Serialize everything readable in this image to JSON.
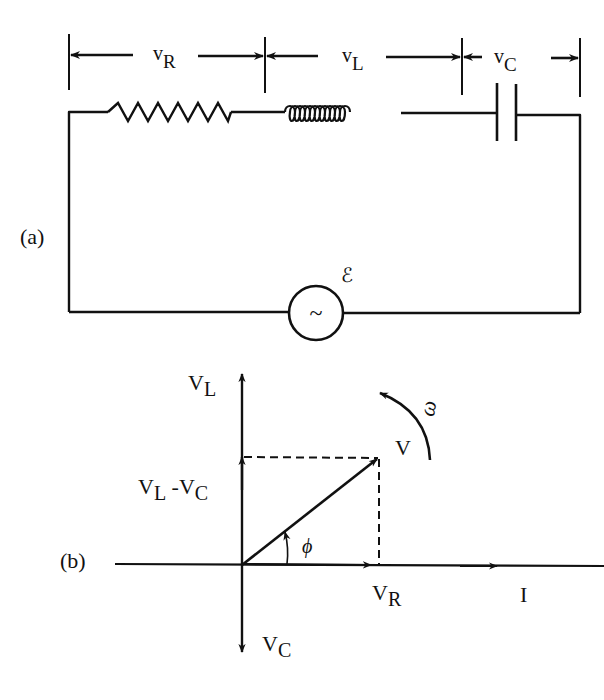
{
  "figure": {
    "part_a": {
      "label": "(a)",
      "dimension_labels": {
        "resistor": {
          "main": "v",
          "sub": "R"
        },
        "inductor": {
          "main": "v",
          "sub": "L"
        },
        "capacitor": {
          "main": "v",
          "sub": "C"
        }
      },
      "source_symbol": "~",
      "emf_symbol": "ℰ",
      "components": [
        "resistor",
        "inductor",
        "capacitor",
        "ac-source"
      ]
    },
    "part_b": {
      "label": "(b)",
      "axis_labels": {
        "vl": {
          "main": "V",
          "sub": "L"
        },
        "vl_minus_vc": {
          "main1": "V",
          "sub1": "L",
          "mid": " -V",
          "sub2": "C"
        },
        "vc": {
          "main": "V",
          "sub": "C"
        },
        "vr": {
          "main": "V",
          "sub": "R"
        },
        "current": "I",
        "voltage": "V",
        "phase": "ϕ",
        "omega": "ω"
      }
    }
  },
  "colors": {
    "ink": "#111111",
    "background": "#ffffff"
  }
}
